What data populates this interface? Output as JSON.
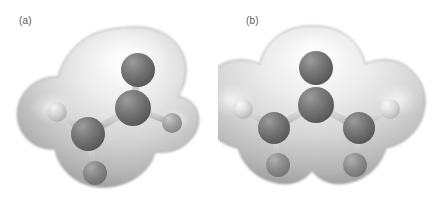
{
  "figure": {
    "kind": "molecular-electron-density-figure",
    "background_color": "#ffffff",
    "width": 437,
    "height": 211,
    "panels": [
      {
        "id": "a",
        "label": "(a)",
        "label_color": "#5a5a5a",
        "description": "Ball-and-stick molecular model enclosed in a translucent gray electron-density isosurface; unsymmetrical (bent / rotated) conformation.",
        "surface": {
          "name": "electron-density-isosurface",
          "fill_light": "#f2f2f2",
          "fill_mid": "#c9c9c9",
          "fill_dark": "#9a9a9a",
          "edge": "#8e8e8e",
          "lobes": 3
        },
        "atoms": [
          {
            "id": "C1",
            "element": "C",
            "role": "terminal-carbon-top",
            "color": "#6f6f6f",
            "cx": 138,
            "cy": 70,
            "r": 17
          },
          {
            "id": "C2",
            "element": "C",
            "role": "central-carbon",
            "color": "#6f6f6f",
            "cx": 133,
            "cy": 108,
            "r": 18
          },
          {
            "id": "C3",
            "element": "C",
            "role": "terminal-carbon-left",
            "color": "#7a7a7a",
            "cx": 88,
            "cy": 134,
            "r": 17
          },
          {
            "id": "H1",
            "element": "H",
            "role": "hydrogen-left",
            "color": "#d4d4d4",
            "cx": 57,
            "cy": 112,
            "r": 10
          },
          {
            "id": "H2",
            "element": "H",
            "role": "hydrogen-right",
            "color": "#a8a8a8",
            "cx": 172,
            "cy": 123,
            "r": 10
          },
          {
            "id": "H3",
            "element": "H",
            "role": "hydrogen-bottom",
            "color": "#8d8d8d",
            "cx": 95,
            "cy": 173,
            "r": 12
          }
        ],
        "bonds": [
          {
            "from": "C1",
            "to": "C2",
            "color": "#c8c8c8"
          },
          {
            "from": "C2",
            "to": "C3",
            "color": "#c8c8c8"
          },
          {
            "from": "C2",
            "to": "H2",
            "color": "#c8c8c8"
          },
          {
            "from": "C3",
            "to": "H1",
            "color": "#c8c8c8"
          },
          {
            "from": "C3",
            "to": "H3",
            "color": "#c8c8c8"
          }
        ]
      },
      {
        "id": "b",
        "label": "(b)",
        "label_color": "#5a5a5a",
        "description": "Ball-and-stick molecular model enclosed in a translucent gray electron-density isosurface; symmetric planar allyl conformation.",
        "surface": {
          "name": "electron-density-isosurface",
          "fill_light": "#f4f4f4",
          "fill_mid": "#cccccc",
          "fill_dark": "#9c9c9c",
          "edge": "#8e8e8e",
          "lobes": 3
        },
        "atoms": [
          {
            "id": "C1",
            "element": "C",
            "role": "central-carbon-top",
            "color": "#6f6f6f",
            "cx": 316,
            "cy": 68,
            "r": 17
          },
          {
            "id": "C2",
            "element": "C",
            "role": "central-carbon",
            "color": "#6f6f6f",
            "cx": 316,
            "cy": 105,
            "r": 18
          },
          {
            "id": "C3",
            "element": "C",
            "role": "terminal-carbon-left",
            "color": "#737373",
            "cx": 274,
            "cy": 128,
            "r": 16
          },
          {
            "id": "C4",
            "element": "C",
            "role": "terminal-carbon-right",
            "color": "#737373",
            "cx": 359,
            "cy": 128,
            "r": 16
          },
          {
            "id": "H1",
            "element": "H",
            "role": "hydrogen-left-outer",
            "color": "#d6d6d6",
            "cx": 243,
            "cy": 109,
            "r": 10
          },
          {
            "id": "H2",
            "element": "H",
            "role": "hydrogen-right-outer",
            "color": "#e0e0e0",
            "cx": 390,
            "cy": 109,
            "r": 10
          },
          {
            "id": "H3",
            "element": "H",
            "role": "hydrogen-left-lower",
            "color": "#969696",
            "cx": 278,
            "cy": 165,
            "r": 12
          },
          {
            "id": "H4",
            "element": "H",
            "role": "hydrogen-right-lower",
            "color": "#969696",
            "cx": 355,
            "cy": 165,
            "r": 12
          }
        ],
        "bonds": [
          {
            "from": "C1",
            "to": "C2",
            "color": "#cccccc"
          },
          {
            "from": "C2",
            "to": "C3",
            "color": "#cccccc"
          },
          {
            "from": "C2",
            "to": "C4",
            "color": "#cccccc"
          },
          {
            "from": "C3",
            "to": "H1",
            "color": "#cccccc"
          },
          {
            "from": "C4",
            "to": "H2",
            "color": "#cccccc"
          },
          {
            "from": "C3",
            "to": "H3",
            "color": "#cccccc"
          },
          {
            "from": "C4",
            "to": "H4",
            "color": "#cccccc"
          }
        ]
      }
    ]
  }
}
